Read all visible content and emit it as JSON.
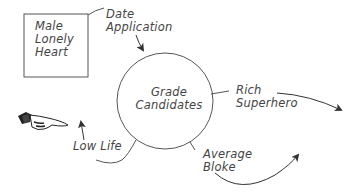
{
  "diagram": {
    "type": "data-flow",
    "external_entity": {
      "lines": [
        "Male",
        "Lonely",
        "Heart"
      ]
    },
    "process": {
      "lines": [
        "Grade",
        "Candidates"
      ]
    },
    "flows": {
      "input": {
        "lines": [
          "Date",
          "Application"
        ]
      },
      "output_1": {
        "lines": [
          "Rich",
          "Superhero"
        ]
      },
      "output_2": {
        "lines": [
          "Average",
          "Bloke"
        ]
      },
      "output_3": {
        "lines": [
          "Low Life"
        ]
      }
    },
    "decoration": {
      "icon": "pointing-hand-icon"
    },
    "colors": {
      "stroke": "#555555",
      "text": "#444444",
      "background": "#ffffff"
    }
  }
}
